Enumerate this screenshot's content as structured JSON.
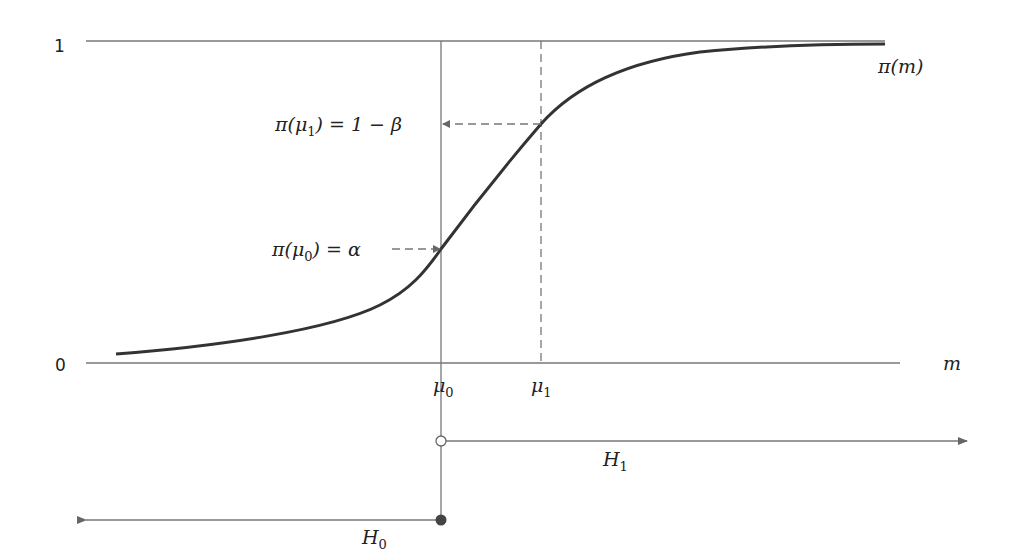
{
  "diagram": {
    "y_ticks": {
      "one": "1",
      "zero": "0"
    },
    "x_axis_label": "m",
    "curve_label": {
      "base": "π(m)"
    },
    "mu0_label": {
      "base": "μ",
      "sub": "0"
    },
    "mu1_label": {
      "base": "μ",
      "sub": "1"
    },
    "pi_mu1_label": {
      "prefix": "π(μ",
      "sub": "1",
      "suffix": ") = 1 − β"
    },
    "pi_mu0_label": {
      "prefix": "π(μ",
      "sub": "0",
      "suffix": ") = α"
    },
    "H1_label": {
      "base": "H",
      "sub": "1"
    },
    "H0_label": {
      "base": "H",
      "sub": "0"
    },
    "colors": {
      "curve": "#333333",
      "axis": "#666666",
      "text": "#222222",
      "filled_dot": "#444444"
    }
  }
}
